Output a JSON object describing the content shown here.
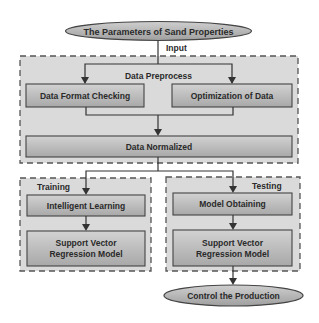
{
  "diagram": {
    "type": "flowchart",
    "colors": {
      "box_fill_top": "#d0d0d0",
      "box_fill_bottom": "#a6a6a6",
      "region_fill": "#d9d9d9",
      "stroke": "#4a4a4a",
      "text": "#2a2a2a"
    },
    "start_node": {
      "label": "The Parameters of Sand Properties"
    },
    "input_label": "Input",
    "preprocess": {
      "title": "Data Preprocess",
      "format_check": "Data Format Checking",
      "optimization": "Optimization of Data",
      "normalized": "Data Normalized"
    },
    "training": {
      "title": "Training",
      "learning": "Intelligent Learning",
      "model_line1": "Support Vector",
      "model_line2": "Regression Model"
    },
    "testing": {
      "title": "Testing",
      "obtaining": "Model Obtaining",
      "model_line1": "Support Vector",
      "model_line2": "Regression Model"
    },
    "end_node": {
      "label": "Control the Production"
    }
  }
}
